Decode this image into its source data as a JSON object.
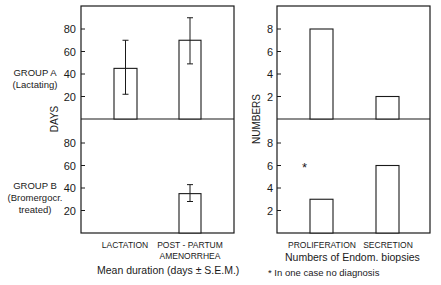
{
  "chart_data": [
    {
      "type": "bar",
      "panel": "left",
      "title": "Mean duration (days ± S.E.M.)",
      "ylabel": "DAYS",
      "categories": [
        "LACTATION",
        "POST-PARTUM AMENORRHEA"
      ],
      "category_lines": [
        [
          "LACTATION"
        ],
        [
          "POST - PARTUM",
          "AMENORRHEA"
        ]
      ],
      "yticks": [
        20,
        40,
        60,
        80
      ],
      "ylim": [
        0,
        100
      ],
      "groups": [
        {
          "name": "GROUP A (Lactating)",
          "label_lines": [
            "GROUP A",
            "(Lactating)"
          ],
          "values": [
            45,
            70
          ],
          "errors": [
            [
              22,
              70
            ],
            [
              49,
              90
            ]
          ]
        },
        {
          "name": "GROUP B (Bromergocr. treated)",
          "label_lines": [
            "GROUP B",
            "(Bromergocr.",
            "treated)"
          ],
          "values": [
            null,
            35
          ],
          "errors": [
            null,
            [
              28,
              43
            ]
          ]
        }
      ],
      "grid": false
    },
    {
      "type": "bar",
      "panel": "right",
      "title": "Numbers of Endom. biopsies",
      "ylabel": "NUMBERS",
      "categories": [
        "PROLIFERATION",
        "SECRETION"
      ],
      "yticks": [
        2,
        4,
        6,
        8
      ],
      "ylim": [
        0,
        10
      ],
      "groups": [
        {
          "name": "GROUP A (Lactating)",
          "values": [
            8,
            2
          ]
        },
        {
          "name": "GROUP B (Bromergocr. treated)",
          "values": [
            3,
            6
          ],
          "annotation": "*"
        }
      ],
      "footnote": "* In one case no diagnosis",
      "grid": false
    }
  ],
  "labels": {
    "left_ylabel": "DAYS",
    "right_ylabel": "NUMBERS",
    "left_title": "Mean  duration (days ± S.E.M.)",
    "right_title": "Numbers of  Endom.  biopsies",
    "footnote": "* In one case no diagnosis",
    "asterisk": "*"
  }
}
